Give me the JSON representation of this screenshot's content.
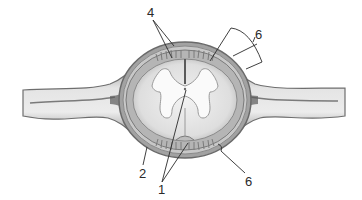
{
  "diagram": {
    "labels": [
      {
        "id": "label-4",
        "text": "4",
        "x": 149,
        "y": 11
      },
      {
        "id": "label-6-top",
        "text": "6",
        "x": 255,
        "y": 28
      },
      {
        "id": "label-2",
        "text": "2",
        "x": 139,
        "y": 167
      },
      {
        "id": "label-1",
        "text": "1",
        "x": 158,
        "y": 181
      },
      {
        "id": "label-6-bottom",
        "text": "6",
        "x": 245,
        "y": 175
      }
    ],
    "colors": {
      "background": "#ffffff",
      "membrane_dark": "#6e6e6e",
      "membrane_mid": "#9a9a9a",
      "membrane_light": "#c8c8c8",
      "white_matter": "#e6e6e6",
      "gray_matter": "#fafafa",
      "leader_line": "#2a2a2a"
    }
  }
}
